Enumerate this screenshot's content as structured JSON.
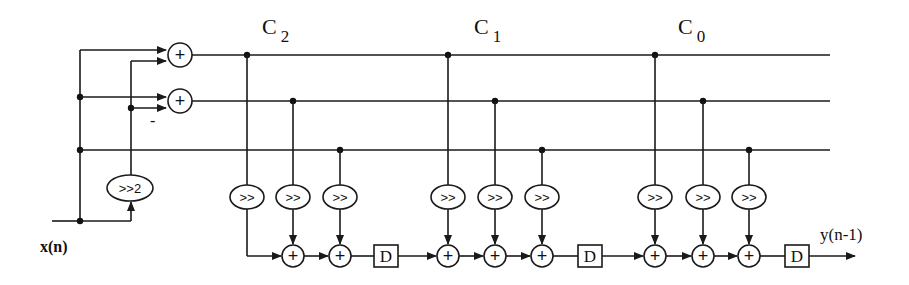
{
  "diagram": {
    "type": "block-diagram",
    "input_label": "x(n)",
    "output_label": "y(n-1)",
    "minus_sign": "-",
    "pre_shift_label": ">>2",
    "coefficient_labels": {
      "c2": {
        "base": "C",
        "sub": "2"
      },
      "c1": {
        "base": "C",
        "sub": "1"
      },
      "c0": {
        "base": "C",
        "sub": "0"
      }
    },
    "shift_label": ">>",
    "adder_symbol": "+",
    "delay_label": "D",
    "colors": {
      "line": "#1a1a1a",
      "background": "#ffffff"
    }
  }
}
